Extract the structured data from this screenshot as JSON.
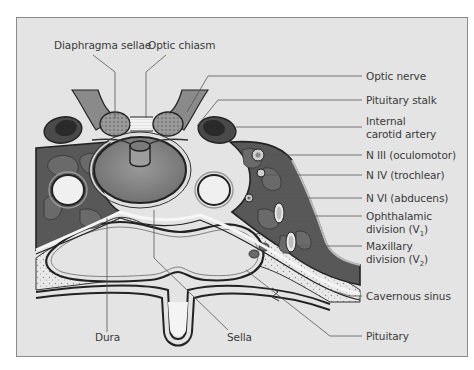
{
  "figure": {
    "background": "#e4e4e4",
    "colors": {
      "cavernous_tissue": "#555555",
      "pituitary": "#7d7d7d",
      "bone_stipple": "#dcdcdc",
      "outline": "#222222",
      "leader": "#555555"
    }
  },
  "labels": {
    "top": [
      {
        "id": "diaphragma-sellae",
        "text": "Diaphragma sellae"
      },
      {
        "id": "optic-chiasm",
        "text": "Optic chiasm"
      }
    ],
    "right": [
      {
        "id": "optic-nerve",
        "text": "Optic nerve"
      },
      {
        "id": "pituitary-stalk",
        "text": "Pituitary stalk"
      },
      {
        "id": "internal-carotid-artery",
        "line1": "Internal",
        "line2": "carotid artery"
      },
      {
        "id": "n3",
        "text": "N III (oculomotor)"
      },
      {
        "id": "n4",
        "text": "N IV (trochlear)"
      },
      {
        "id": "n6",
        "text": "N VI (abducens)"
      },
      {
        "id": "ophthalmic-division",
        "line1": "Ophthalamic",
        "line2_prefix": "division (V",
        "line2_sub": "1",
        "line2_suffix": ")"
      },
      {
        "id": "maxillary-division",
        "line1": "Maxillary",
        "line2_prefix": "division (V",
        "line2_sub": "2",
        "line2_suffix": ")"
      },
      {
        "id": "cavernous-sinus",
        "text": "Cavernous sinus"
      },
      {
        "id": "pituitary",
        "text": "Pituitary"
      }
    ],
    "bottom": [
      {
        "id": "dura",
        "text": "Dura"
      },
      {
        "id": "sella",
        "text": "Sella"
      }
    ]
  }
}
